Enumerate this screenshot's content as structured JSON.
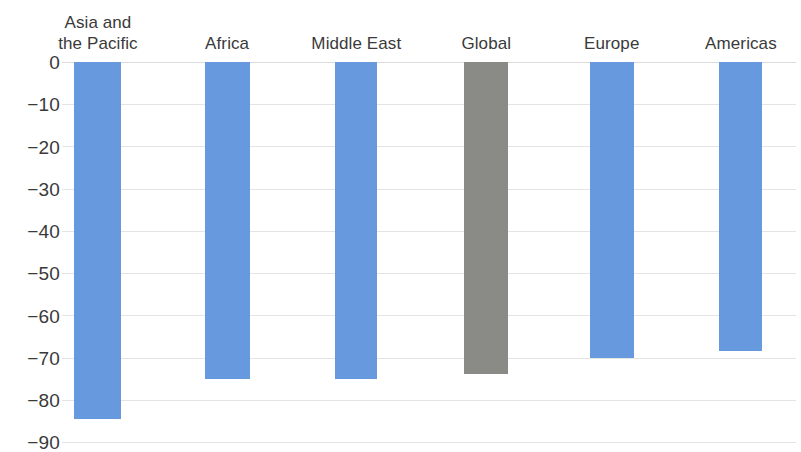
{
  "chart_data": {
    "type": "bar",
    "title": "",
    "subtitle": "",
    "xlabel": "",
    "ylabel": "",
    "ylim": [
      -90,
      0
    ],
    "ytick_step": 10,
    "grid": true,
    "legend": "none",
    "categories": [
      "Asia and\nthe Pacific",
      "Africa",
      "Middle East",
      "Global",
      "Europe",
      "Americas"
    ],
    "values": [
      -84.5,
      -75,
      -75,
      -74,
      -70,
      -68.5
    ],
    "bar_colors": [
      "#6699dd",
      "#6699dd",
      "#6699dd",
      "#8a8a87",
      "#6699dd",
      "#6699dd"
    ],
    "ytick_labels": [
      "0",
      "−10",
      "−20",
      "−30",
      "−40",
      "−50",
      "−60",
      "−70",
      "−80",
      "−90"
    ],
    "ytick_values": [
      0,
      -10,
      -20,
      -30,
      -40,
      -50,
      -60,
      -70,
      -80,
      -90
    ],
    "colors": {
      "bar_blue": "#6699dd",
      "bar_gray": "#8a8a87",
      "gridline": "#e4e4e4",
      "text": "#3a3a3a",
      "background": "#ffffff"
    },
    "bar_geometry": [
      {
        "center_pct": 4.9,
        "width_px": 47
      },
      {
        "center_pct": 22.5,
        "width_px": 45
      },
      {
        "center_pct": 40.1,
        "width_px": 42
      },
      {
        "center_pct": 57.8,
        "width_px": 44
      },
      {
        "center_pct": 74.9,
        "width_px": 44
      },
      {
        "center_pct": 92.5,
        "width_px": 43
      }
    ]
  }
}
